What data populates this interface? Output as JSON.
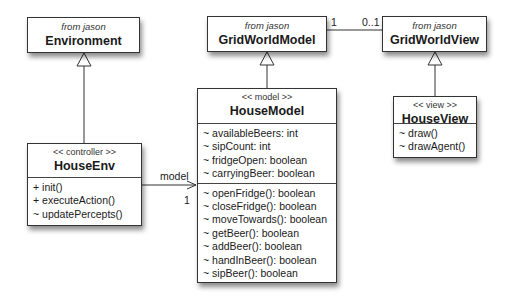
{
  "classes": {
    "environment": {
      "package": "from jason",
      "name": "Environment"
    },
    "gridworldmodel": {
      "package": "from jason",
      "name": "GridWorldModel"
    },
    "gridworldview": {
      "package": "from jason",
      "name": "GridWorldView"
    },
    "houseenv": {
      "stereotype": "<< controller >>",
      "name": "HouseEnv",
      "methods": [
        "+ init()",
        "+ executeAction()",
        "~ updatePercepts()"
      ]
    },
    "housemodel": {
      "stereotype": "<< model >>",
      "name": "HouseModel",
      "attributes": [
        "~ availableBeers: int",
        "~ sipCount: int",
        "~ fridgeOpen: boolean",
        "~ carryingBeer: boolean"
      ],
      "methods": [
        "~ openFridge(): boolean",
        "~ closeFridge(): boolean",
        "~ moveTowards(): boolean",
        "~ getBeer(): boolean",
        "~ addBeer(): boolean",
        "~ handInBeer(): boolean",
        "~ sipBeer(): boolean"
      ]
    },
    "houseview": {
      "stereotype": "<< view >>",
      "name": "HouseView",
      "methods": [
        "~ draw()",
        "~ drawAgent()"
      ]
    }
  },
  "associations": {
    "model_view": {
      "source_multiplicity": "1",
      "target_multiplicity": "0..1"
    },
    "env_model": {
      "role": "model",
      "multiplicity": "1"
    }
  },
  "colors": {
    "line": "#333333",
    "box_fill": "#ffffff",
    "text": "#1a1a1a"
  }
}
